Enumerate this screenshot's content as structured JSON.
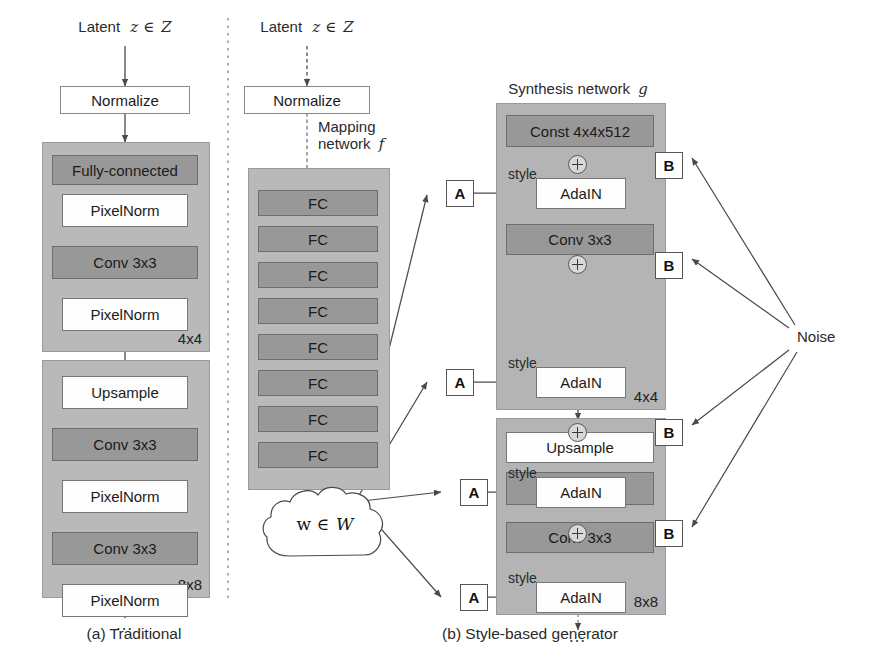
{
  "figure": {
    "divider": "vertical-dotted-separator",
    "noise_label": "Noise"
  },
  "panel_a": {
    "caption": "(a) Traditional",
    "latent_label": "Latent",
    "latent_symbol": "z ∈",
    "latent_space": "Z",
    "normalize": "Normalize",
    "stage1": {
      "size": "4x4",
      "nodes": [
        {
          "label": "Fully-connected",
          "style": "dark"
        },
        {
          "label": "PixelNorm",
          "style": "light"
        },
        {
          "label": "Conv 3x3",
          "style": "dark"
        },
        {
          "label": "PixelNorm",
          "style": "light"
        }
      ]
    },
    "stage2": {
      "size": "8x8",
      "nodes": [
        {
          "label": "Upsample",
          "style": "light"
        },
        {
          "label": "Conv 3x3",
          "style": "dark"
        },
        {
          "label": "PixelNorm",
          "style": "light"
        },
        {
          "label": "Conv 3x3",
          "style": "dark"
        },
        {
          "label": "PixelNorm",
          "style": "light"
        }
      ]
    },
    "trailing_ellipsis": "…"
  },
  "panel_b": {
    "caption": "(b) Style-based generator",
    "latent_label": "Latent",
    "latent_symbol": "z ∈",
    "latent_space": "Z",
    "normalize": "Normalize",
    "mapping_title_line1": "Mapping",
    "mapping_title_line2": "network",
    "mapping_title_symbol": "f",
    "mapping_layers": [
      "FC",
      "FC",
      "FC",
      "FC",
      "FC",
      "FC",
      "FC",
      "FC"
    ],
    "intermediate_latent": "w ∈",
    "intermediate_latent_space": "W",
    "synthesis_title": "Synthesis network",
    "synthesis_title_symbol": "g",
    "style_label": "style",
    "tap_a": "A",
    "tap_b": "B",
    "stage1": {
      "size": "4x4",
      "nodes": [
        {
          "label": "Const 4x4x512",
          "style": "dark"
        },
        {
          "label": "AdaIN",
          "style": "light"
        },
        {
          "label": "Conv 3x3",
          "style": "dark"
        },
        {
          "label": "AdaIN",
          "style": "light"
        }
      ]
    },
    "stage2": {
      "size": "8x8",
      "nodes": [
        {
          "label": "Upsample",
          "style": "light"
        },
        {
          "label": "Conv 3x3",
          "style": "dark"
        },
        {
          "label": "AdaIN",
          "style": "light"
        },
        {
          "label": "Conv 3x3",
          "style": "dark"
        },
        {
          "label": "AdaIN",
          "style": "light"
        }
      ]
    },
    "trailing_ellipsis": "…"
  },
  "colors": {
    "stage_fill": "#b9b9b9",
    "dark_node": "#989898",
    "light_node": "#fdfdfd",
    "line": "#4a4a4a",
    "text": "#2a2a2a"
  }
}
